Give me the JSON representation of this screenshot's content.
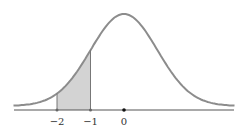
{
  "chart_data": {
    "type": "area",
    "title": "",
    "xlabel": "",
    "ylabel": "",
    "x_ticks": [
      {
        "value": -2,
        "label": "−2"
      },
      {
        "value": -1,
        "label": "−1"
      },
      {
        "value": 0,
        "label": "0"
      }
    ],
    "distribution": {
      "name": "normal",
      "mean": 0,
      "sd": 1
    },
    "shaded_region": {
      "from": -2,
      "to": -1
    },
    "xlim": [
      -3.3,
      3.3
    ],
    "grid": false,
    "legend": null
  },
  "colors": {
    "curve": "#8c8c8c",
    "shade": "#d3d3d3",
    "axis": "#555555",
    "marker": "#111111"
  }
}
